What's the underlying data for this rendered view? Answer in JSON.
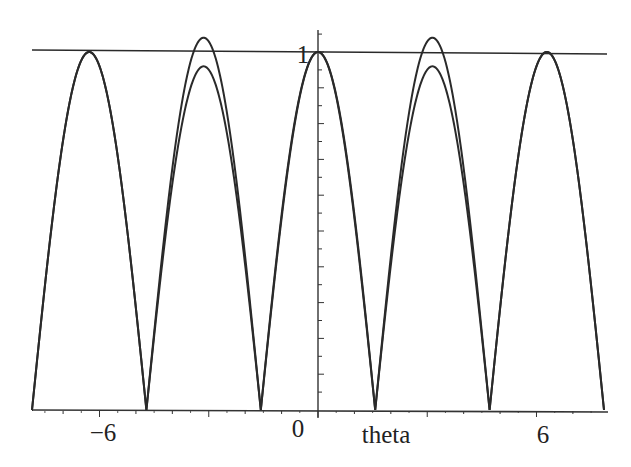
{
  "chart_data": {
    "type": "line",
    "title": "",
    "xlabel": "theta",
    "ylabel": "",
    "xlim": [
      -7.854,
      7.854
    ],
    "ylim": [
      0,
      1.05
    ],
    "x_ticks": [
      -6,
      0,
      6
    ],
    "x_tick_labels": [
      "-6",
      "0",
      "6"
    ],
    "y_ticks": [
      1
    ],
    "y_tick_labels": [
      "1"
    ],
    "grid": false,
    "legend": null,
    "series": [
      {
        "name": "upper curve",
        "description": "|cos(theta)|-shaped arches; peaks 1 at theta = -2pi, 0, 2pi and about 1.04 at theta = +/-pi; zeros at +/-pi/2, +/-3pi/2",
        "x": [
          -7.854,
          -6.283,
          -4.712,
          -3.1416,
          -1.5708,
          0,
          1.5708,
          3.1416,
          4.712,
          6.283,
          7.854
        ],
        "values": [
          0,
          1.0,
          0,
          1.04,
          0,
          1.0,
          0,
          1.04,
          0,
          1.0,
          0
        ]
      },
      {
        "name": "lower curve",
        "description": "same arches but peaks about 0.96 at theta = +/-pi",
        "x": [
          -7.854,
          -6.283,
          -4.712,
          -3.1416,
          -1.5708,
          0,
          1.5708,
          3.1416,
          4.712,
          6.283,
          7.854
        ],
        "values": [
          0,
          1.0,
          0,
          0.96,
          0,
          1.0,
          0,
          0.96,
          0,
          1.0,
          0
        ]
      },
      {
        "name": "horizontal line y=1",
        "x": [
          -7.854,
          7.854
        ],
        "values": [
          1,
          1
        ]
      }
    ]
  },
  "labels": {
    "x_tick_neg6": "−6",
    "x_tick_0": "0",
    "x_tick_6": "6",
    "y_tick_1": "1",
    "x_axis_label": "theta"
  },
  "style": {
    "line_color": "#2a2a2a",
    "axis_color": "#333333",
    "background": "#ffffff"
  }
}
